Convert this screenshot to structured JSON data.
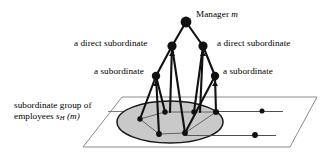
{
  "figure": {
    "background_color": "#ffffff",
    "labels": {
      "manager": {
        "text": "Manager ",
        "symbol": "m"
      },
      "direct_subordinate_left": "a direct subordinate",
      "direct_subordinate_right": "a direct subordinate",
      "subordinate_left": "a subordinate",
      "subordinate_right": "a subordinate",
      "group_line1": "subordinate group of",
      "group_line2_prefix": "employees ",
      "group_symbol": "s",
      "group_subscript": "H",
      "group_argument": " (m)"
    },
    "colors": {
      "stroke": "#1a1a1a",
      "node_fill": "#111111",
      "ellipse_fill": "#c9c9c9",
      "ellipse_stroke": "#1a1a1a",
      "plane_stroke": "#8a8a8a",
      "thin_line": "#6f6f6f"
    },
    "nodes": {
      "manager": {
        "name": "manager-node",
        "cx": 186,
        "cy": 22,
        "r": 5.4
      },
      "direct_left": {
        "name": "direct-subordinate-left-node",
        "cx": 172,
        "cy": 46,
        "r": 4.6
      },
      "direct_right": {
        "name": "direct-subordinate-right-node",
        "cx": 203,
        "cy": 46,
        "r": 4.6
      },
      "sub_left": {
        "name": "subordinate-left-node",
        "cx": 156,
        "cy": 76,
        "r": 4.2
      },
      "sub_right": {
        "name": "subordinate-right-node",
        "cx": 215,
        "cy": 76,
        "r": 4.2
      },
      "leaves": [
        {
          "name": "employee-node-1",
          "cx": 140,
          "cy": 119,
          "r": 2.7
        },
        {
          "name": "employee-node-2",
          "cx": 165,
          "cy": 112,
          "r": 2.7
        },
        {
          "name": "employee-node-3",
          "cx": 159,
          "cy": 134,
          "r": 2.9
        },
        {
          "name": "employee-node-4",
          "cx": 185,
          "cy": 133,
          "r": 2.9
        },
        {
          "name": "employee-node-5",
          "cx": 194,
          "cy": 112,
          "r": 2.7
        },
        {
          "name": "employee-node-6",
          "cx": 216,
          "cy": 112,
          "r": 3.0
        },
        {
          "name": "outside-node-1",
          "cx": 262,
          "cy": 111,
          "r": 2.5
        },
        {
          "name": "outside-node-2",
          "cx": 255,
          "cy": 135,
          "r": 2.9
        }
      ]
    },
    "plane": {
      "name": "employee-plane",
      "points": "122,97 317,97 290,147 83,147"
    },
    "ellipse": {
      "name": "subordinate-group-ellipse",
      "cx": 170,
      "cy": 122,
      "rx": 53,
      "ry": 21
    }
  }
}
